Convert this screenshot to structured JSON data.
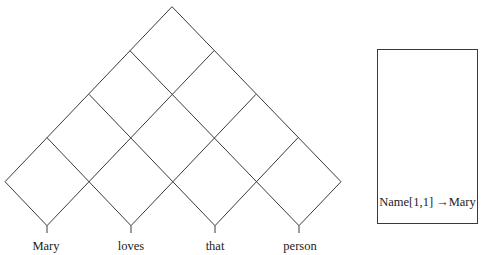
{
  "chart": {
    "type": "cky-parse-chart",
    "words": [
      "Mary",
      "loves",
      "that",
      "person"
    ]
  },
  "side_panel": {
    "entry_name": "Name[1,1]",
    "arrow": "→",
    "entry_value": "Mary"
  }
}
